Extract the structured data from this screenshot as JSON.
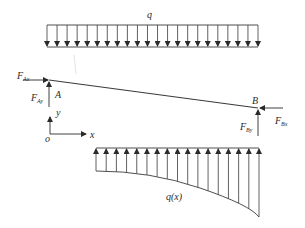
{
  "diagram": {
    "colors": {
      "line": "#3a3a3a",
      "text": "#2a2a2a",
      "faint": "#d8d8d8"
    },
    "top_load": {
      "label": "q",
      "type": "uniform distributed load (downward)",
      "x_start": 47,
      "x_end": 258,
      "y_top": 25,
      "y_bottom": 47,
      "arrow_count": 22
    },
    "beam": {
      "start": {
        "x": 49,
        "y": 80,
        "label": "A"
      },
      "end": {
        "x": 258,
        "y": 108,
        "label": "B"
      }
    },
    "forces": {
      "F_Ax": {
        "base": "F",
        "sub": "Ax",
        "direction": "right"
      },
      "F_Ay": {
        "base": "F",
        "sub": "Ay",
        "direction": "up"
      },
      "F_Bx": {
        "base": "F",
        "sub": "Bx",
        "direction": "left"
      },
      "F_By": {
        "base": "F",
        "sub": "By",
        "direction": "up"
      }
    },
    "axes": {
      "origin_label": "o",
      "x_label": "x",
      "y_label": "y"
    },
    "bottom_load": {
      "label": "q(x)",
      "type": "varying distributed load (upward)",
      "x_start": 96,
      "x_end": 259,
      "y_top": 148,
      "arrow_count": 17
    }
  }
}
